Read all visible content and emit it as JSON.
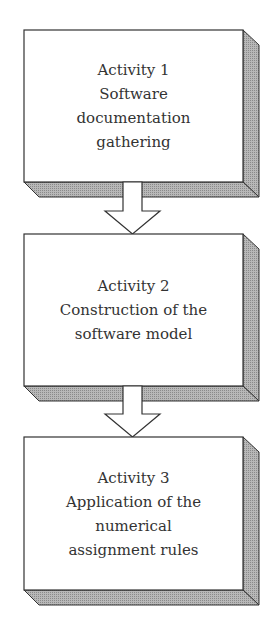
{
  "diagram": {
    "type": "flowchart",
    "direction": "top-to-bottom",
    "colors": {
      "box_fill": "#ffffff",
      "box_stroke": "#333333",
      "shadow_fill": "#aaaaaa",
      "text": "#333333",
      "arrow_fill": "#ffffff"
    },
    "nodes": [
      {
        "id": "activity-1",
        "lines": [
          "Activity 1",
          "Software",
          "documentation",
          "gathering"
        ]
      },
      {
        "id": "activity-2",
        "lines": [
          "Activity 2",
          "Construction of the",
          "software model"
        ]
      },
      {
        "id": "activity-3",
        "lines": [
          "Activity 3",
          "Application of the",
          "numerical",
          "assignment rules"
        ]
      }
    ],
    "edges": [
      {
        "from": "activity-1",
        "to": "activity-2",
        "style": "block-arrow"
      },
      {
        "from": "activity-2",
        "to": "activity-3",
        "style": "block-arrow"
      }
    ]
  }
}
